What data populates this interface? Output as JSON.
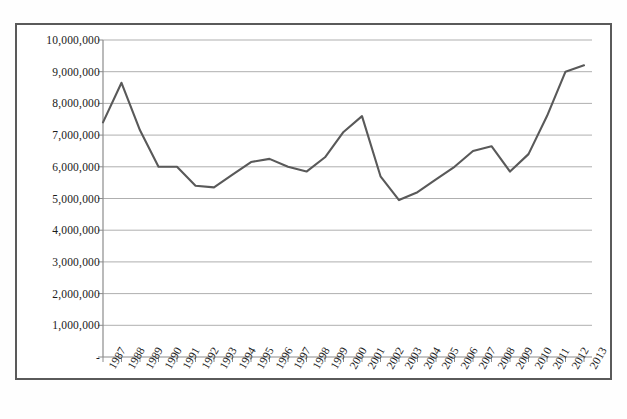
{
  "chart": {
    "type": "line",
    "title": "",
    "xlabel": "",
    "ylabel": "",
    "line_color": "#595959",
    "gridline_color": "#a6a6a6",
    "axis_color": "#808080",
    "border_color": "#5a5a5a",
    "background": "#ffffff"
  },
  "axes": {
    "y_ticks": [
      "-",
      "1,000,000",
      "2,000,000",
      "3,000,000",
      "4,000,000",
      "5,000,000",
      "6,000,000",
      "7,000,000",
      "8,000,000",
      "9,000,000",
      "10,000,000"
    ],
    "y_tick_values": [
      0,
      1000000,
      2000000,
      3000000,
      4000000,
      5000000,
      6000000,
      7000000,
      8000000,
      9000000,
      10000000
    ],
    "ylim": [
      0,
      10000000
    ],
    "grid": true,
    "legend": "none"
  },
  "chart_data": {
    "type": "line",
    "title": "",
    "xlabel": "",
    "ylabel": "",
    "ylim": [
      0,
      10000000
    ],
    "xlim": [
      "1987",
      "2013"
    ],
    "grid": true,
    "legend_position": "none",
    "categories": [
      "1987",
      "1988",
      "1989",
      "1990",
      "1991",
      "1992",
      "1993",
      "1994",
      "1995",
      "1996",
      "1997",
      "1998",
      "1999",
      "2000",
      "2001",
      "2002",
      "2003",
      "2004",
      "2005",
      "2006",
      "2007",
      "2008",
      "2009",
      "2010",
      "2011",
      "2012",
      "2013"
    ],
    "values": [
      7400000,
      8650000,
      7150000,
      6000000,
      6000000,
      5400000,
      5350000,
      5750000,
      6150000,
      6250000,
      6000000,
      5850000,
      6300000,
      7100000,
      7600000,
      5700000,
      4950000,
      5200000,
      5600000,
      6000000,
      6500000,
      6650000,
      5850000,
      6400000,
      7600000,
      9000000,
      9200000
    ],
    "ytick_labels": [
      "-",
      "1,000,000",
      "2,000,000",
      "3,000,000",
      "4,000,000",
      "5,000,000",
      "6,000,000",
      "7,000,000",
      "8,000,000",
      "9,000,000",
      "10,000,000"
    ],
    "ytick_values": [
      0,
      1000000,
      2000000,
      3000000,
      4000000,
      5000000,
      6000000,
      7000000,
      8000000,
      9000000,
      10000000
    ]
  }
}
